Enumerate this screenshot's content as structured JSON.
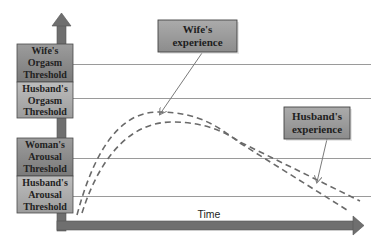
{
  "diagram": {
    "y_axis": {
      "labels": [
        {
          "id": "wife-orgasm-threshold",
          "lines": [
            "Wife's",
            "Orgasm",
            "Threshold"
          ]
        },
        {
          "id": "husband-orgasm-threshold",
          "lines": [
            "Husband's",
            "Orgasm",
            "Threshold"
          ]
        },
        {
          "id": "woman-arousal-threshold",
          "lines": [
            "Woman's",
            "Arousal",
            "Threshold"
          ]
        },
        {
          "id": "husband-arousal-threshold",
          "lines": [
            "Husband's",
            "Arousal",
            "Threshold"
          ]
        }
      ]
    },
    "x_axis": {
      "label": "Time"
    },
    "callouts": [
      {
        "id": "wife-experience",
        "lines": [
          "Wife's",
          "experience"
        ]
      },
      {
        "id": "husband-experience",
        "lines": [
          "Husband's",
          "experience"
        ]
      }
    ],
    "colors": {
      "axis": "#6f6f6f",
      "threshold_line": "#9a9a9a",
      "curve": "#6a6a6a",
      "box_dark": "#858585",
      "box_light": "#a8a8a8",
      "box_border": "#4a4a4a"
    }
  }
}
